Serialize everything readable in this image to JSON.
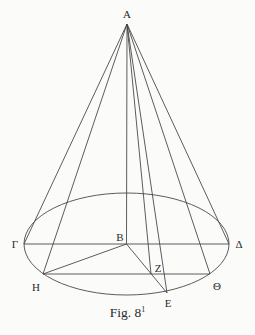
{
  "figure": {
    "caption": "Fig. 8",
    "caption_superscript": "1",
    "colors": {
      "background": "#fbfbfa",
      "line": "#4a4a4a",
      "text": "#2a2a2a"
    },
    "points": {
      "A": {
        "label": "A",
        "x": 127,
        "y": 24
      },
      "B": {
        "label": "B",
        "x": 126.5,
        "y": 244
      },
      "Gamma": {
        "label": "Γ",
        "x": 24,
        "y": 244
      },
      "Delta": {
        "label": "Δ",
        "x": 229,
        "y": 244
      },
      "H": {
        "label": "H",
        "x": 43,
        "y": 274
      },
      "Theta": {
        "label": "Θ",
        "x": 210,
        "y": 274
      },
      "Z": {
        "label": "Z",
        "x": 151,
        "y": 274
      },
      "E": {
        "label": "E",
        "x": 167,
        "y": 293
      }
    },
    "ellipse": {
      "cx": 126.5,
      "cy": 244,
      "rx": 102.5,
      "ry": 51
    },
    "segments": [
      [
        "A",
        "Gamma"
      ],
      [
        "A",
        "H"
      ],
      [
        "A",
        "B"
      ],
      [
        "A",
        "Z"
      ],
      [
        "A",
        "E"
      ],
      [
        "A",
        "Theta"
      ],
      [
        "A",
        "Delta"
      ],
      [
        "Gamma",
        "Delta"
      ],
      [
        "H",
        "Theta"
      ],
      [
        "H",
        "B"
      ],
      [
        "B",
        "E"
      ]
    ]
  }
}
